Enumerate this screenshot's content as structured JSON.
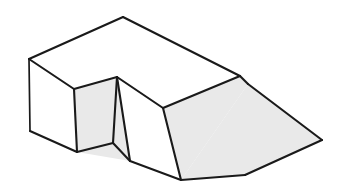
{
  "figure": {
    "type": "line-drawing",
    "canvas": {
      "width": 354,
      "height": 194
    },
    "style": {
      "background_color": "#ffffff",
      "line_color": "#1a1a1a",
      "shaded_face_color": "#e9e9e9",
      "unshaded_face_color": "#ffffff",
      "stroke_width_main": 2.1,
      "stroke_width_thin": 1.7
    },
    "vertices": {
      "top_apex": [
        123,
        17
      ],
      "top_left": [
        29,
        59
      ],
      "top_right_far": [
        240,
        76
      ],
      "notch_top_apex": [
        117,
        77
      ],
      "notch_left_top": [
        74,
        89
      ],
      "notch_right_top": [
        163,
        108
      ],
      "left_bottom": [
        30,
        131
      ],
      "notch_left_bottom": [
        77,
        152
      ],
      "notch_inner_bottom": [
        113,
        143
      ],
      "notch_front_bottom": [
        130,
        161
      ],
      "block_right_bottom": [
        181,
        180
      ],
      "ramp_top_back": [
        248,
        84
      ],
      "ramp_right": [
        322,
        140
      ],
      "ramp_bottom": [
        245,
        175
      ]
    },
    "faces": [
      {
        "name": "top-face",
        "shading": "white",
        "points": "29,59 123,17 240,76 163,108 117,77 74,89"
      },
      {
        "name": "left-side-face",
        "shading": "white",
        "points": "29,59 74,89 77,152 30,131"
      },
      {
        "name": "notch-left-inner-face",
        "shading": "shaded",
        "points": "74,89 117,77 113,143 77,152"
      },
      {
        "name": "notch-right-inner-face",
        "shading": "shaded",
        "points": "117,77 113,143 130,161"
      },
      {
        "name": "notch-floor-face",
        "shading": "shaded",
        "points": "77,152 113,143 130,161"
      },
      {
        "name": "block-front-face",
        "shading": "white",
        "points": "117,77 163,108 181,180 130,161"
      },
      {
        "name": "block-right-face",
        "shading": "shaded",
        "points": "163,108 240,76 248,84 181,180"
      },
      {
        "name": "ramp-face",
        "shading": "shaded",
        "points": "248,84 322,140 245,175 181,180"
      }
    ],
    "edges": [
      {
        "name": "top-back-left-edge",
        "path": "M29,59 L123,17"
      },
      {
        "name": "top-back-right-edge",
        "path": "M123,17 L240,76"
      },
      {
        "name": "top-front-right-edge",
        "path": "M240,76 L163,108"
      },
      {
        "name": "notch-top-right-edge",
        "path": "M163,108 L117,77"
      },
      {
        "name": "notch-top-left-edge",
        "path": "M117,77 L74,89"
      },
      {
        "name": "top-front-left-edge",
        "path": "M74,89 L29,59"
      },
      {
        "name": "left-vertical-edge",
        "path": "M29,59 L30,131"
      },
      {
        "name": "left-bottom-edge",
        "path": "M30,131 L77,152"
      },
      {
        "name": "notch-left-vertical-edge",
        "path": "M74,89 L77,152"
      },
      {
        "name": "notch-center-vertical-edge",
        "path": "M117,77 L113,143"
      },
      {
        "name": "notch-front-diagonal-edge",
        "path": "M117,77 L130,161"
      },
      {
        "name": "notch-floor-left-edge",
        "path": "M77,152 L113,143"
      },
      {
        "name": "notch-floor-right-edge",
        "path": "M113,143 L130,161"
      },
      {
        "name": "block-front-bottom-edge",
        "path": "M130,161 L181,180"
      },
      {
        "name": "block-front-vertical-edge",
        "path": "M163,108 L181,180"
      },
      {
        "name": "block-right-top-edge",
        "path": "M240,76 L248,84"
      },
      {
        "name": "ramp-top-edge",
        "path": "M248,84 L322,140"
      },
      {
        "name": "ramp-right-edge",
        "path": "M322,140 L245,175"
      },
      {
        "name": "ramp-bottom-edge",
        "path": "M245,175 L181,180"
      }
    ]
  }
}
